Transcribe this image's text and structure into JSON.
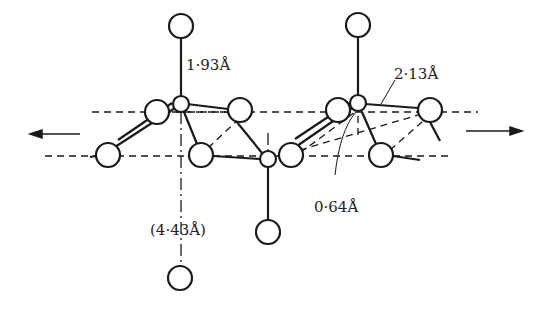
{
  "labels": {
    "bond_vertical": "1·93Å",
    "bond_diagonal": "2·13Å",
    "offset": "0·64Å",
    "layer_spacing": "(4·43Å)"
  },
  "colors": {
    "ink": "#1a1a1a",
    "background": "#ffffff"
  }
}
